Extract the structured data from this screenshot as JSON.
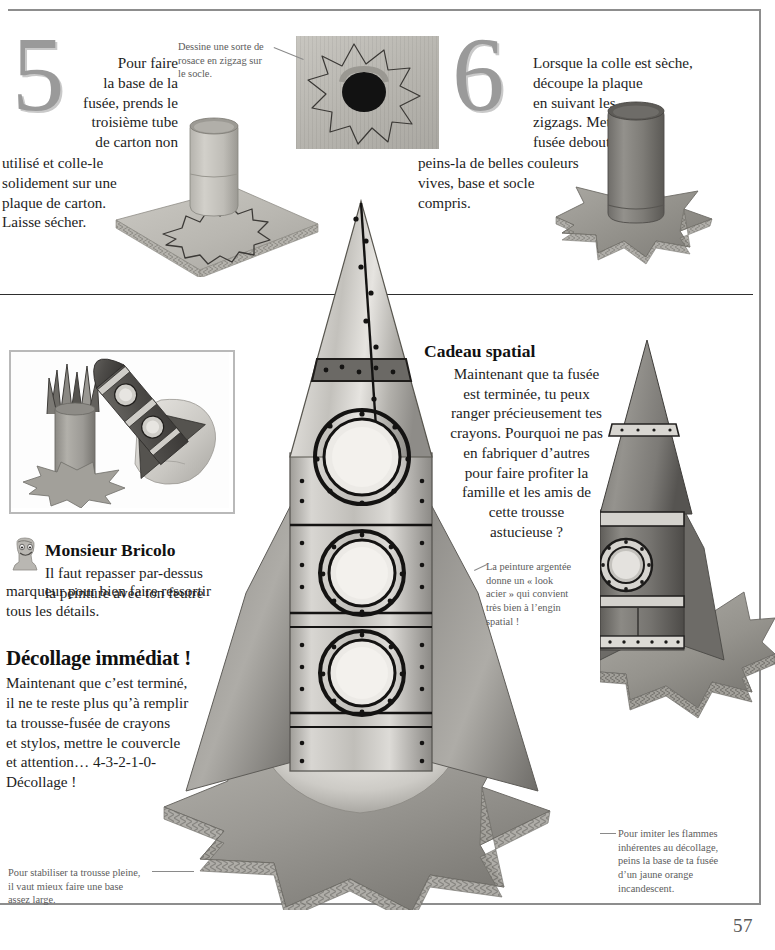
{
  "page": {
    "number": "57",
    "language": "fr"
  },
  "step5": {
    "number": "5",
    "lines": [
      "Pour faire",
      "la base de la",
      "fusée, prends le",
      "troisième tube",
      "de carton non",
      "utilisé et colle-le",
      "solidement sur une",
      "plaque de carton.",
      "Laisse sécher."
    ]
  },
  "step6": {
    "number": "6",
    "lines": [
      "Lorsque la colle est sèche,",
      "découpe la plaque",
      "en suivant les",
      "zigzags. Mets la",
      "fusée debout et",
      "peins-la de belles couleurs",
      "vives, base et socle",
      "compris."
    ]
  },
  "captions": {
    "rosace": {
      "name": "rosace-caption",
      "lines": [
        "Dessine une sorte de",
        "rosace en zigzag sur",
        "le socle."
      ]
    },
    "peinture_argentee": {
      "name": "silver-paint-caption",
      "lines": [
        "La peinture argentée",
        "donne un « look",
        "acier » qui convient",
        "très bien à l’engin",
        "spatial !"
      ]
    },
    "base_large": {
      "name": "wide-base-caption",
      "lines": [
        "Pour stabiliser ta trousse pleine,",
        "il vaut mieux faire une base",
        "assez large."
      ]
    },
    "flammes": {
      "name": "flames-caption",
      "lines": [
        "Pour imiter les flammes",
        "inhérentes au décollage,",
        "peins la base de ta fusée",
        "d’un jaune orange",
        "incandescent."
      ]
    }
  },
  "cadeau_spatial": {
    "title": "Cadeau spatial",
    "lines": [
      "Maintenant que ta fusée",
      "est terminée, tu peux",
      "ranger précieusement tes",
      "crayons. Pourquoi ne pas",
      "en fabriquer d’autres",
      "pour faire profiter la",
      "famille et les amis de",
      "cette trousse",
      "astucieuse ?"
    ]
  },
  "monsieur_bricolo": {
    "title": "Monsieur Bricolo",
    "lines": [
      "Il faut repasser par-dessus",
      "la peinture avec ton feutre",
      "marqueur pour bien faire ressortir",
      "tous les détails."
    ]
  },
  "decollage": {
    "title": "Décollage immédiat !",
    "lines": [
      "Maintenant que c’est terminé,",
      "il ne te reste plus qu’à remplir",
      "ta trousse-fusée de crayons",
      "et stylos, mettre le couvercle",
      "et attention… 4-3-2-1-0-",
      "Décollage !"
    ]
  },
  "colors": {
    "rule": "#2e2e2e",
    "frame": "#8d8d8d",
    "caption_text": "#5d5d5d",
    "body_text": "#1d1d1d",
    "step_number": "#9a9a9a"
  }
}
